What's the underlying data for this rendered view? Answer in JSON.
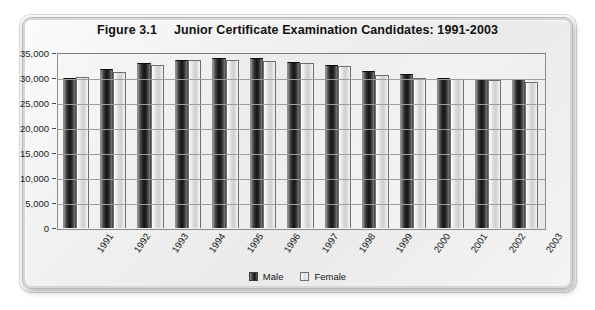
{
  "figure": {
    "label": "Figure 3.1",
    "title": "Junior Certificate Examination Candidates: 1991-2003"
  },
  "legend": {
    "male_label": "Male",
    "female_label": "Female",
    "male_color": "#1a1a1a",
    "female_color": "#d9d9d9",
    "position": "bottom-center"
  },
  "axis": {
    "y_ticks": [
      "0",
      "5,000",
      "10,000",
      "15,000",
      "20,000",
      "25,000",
      "30,000",
      "35,000"
    ]
  },
  "chart_data": {
    "type": "bar",
    "xlabel": "",
    "ylabel": "",
    "ylim": [
      0,
      35000
    ],
    "ytick_step": 5000,
    "grid": true,
    "legend_position": "bottom-center",
    "categories": [
      "1991",
      "1992",
      "1993",
      "1994",
      "1995",
      "1996",
      "1997",
      "1998",
      "1999",
      "2000",
      "2001",
      "2002",
      "2003"
    ],
    "series": [
      {
        "name": "Male",
        "color": "#1a1a1a",
        "values": [
          30000,
          31900,
          33000,
          33700,
          34100,
          34100,
          33300,
          32700,
          31500,
          30900,
          30100,
          29900,
          29900
        ]
      },
      {
        "name": "Female",
        "color": "#d9d9d9",
        "values": [
          30200,
          31300,
          32700,
          33700,
          33700,
          33400,
          33100,
          32400,
          30700,
          30000,
          29900,
          29600,
          29300
        ]
      }
    ]
  }
}
